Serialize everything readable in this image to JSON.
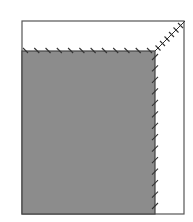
{
  "diagram": {
    "type": "fold-and-stitch-illustration",
    "outer_panel": {
      "x": 22,
      "y": 21,
      "width": 162,
      "height": 193,
      "fill": "#ffffff",
      "stroke": "#555555"
    },
    "folded_panel": {
      "x": 22,
      "y": 51,
      "width": 133,
      "height": 163,
      "fill": "#8c8c8c",
      "stroke": "#444444"
    },
    "stitches": {
      "top_edge": {
        "count": 12,
        "direction": "backslash",
        "color": "#333333"
      },
      "right_edge": {
        "count": 14,
        "direction": "slash",
        "color": "#333333"
      },
      "diagonal_corner": {
        "from": [
          155,
          51
        ],
        "to": [
          185,
          21
        ],
        "count": 6,
        "style": "cross",
        "color": "#333333"
      }
    }
  }
}
